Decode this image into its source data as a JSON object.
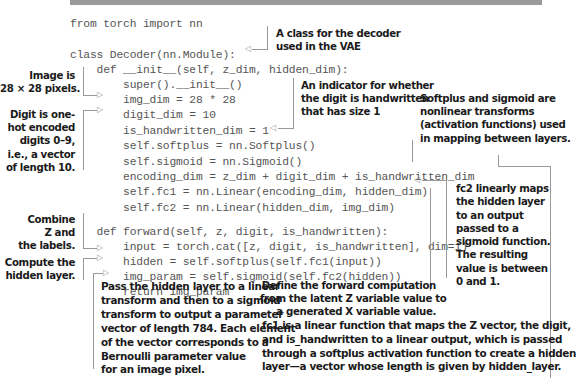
{
  "code_lines": [
    "from torch import nn",
    "",
    "class Decoder(nn.Module):",
    "    def __init__(self, z_dim, hidden_dim):",
    "        super().__init__()",
    "        img_dim = 28 * 28",
    "        digit_dim = 10",
    "        is_handwritten_dim = 1",
    "        self.softplus = nn.Softplus()",
    "        self.sigmoid = nn.Sigmoid()",
    "        encoding_dim = z_dim + digit_dim + is_handwritten_dim",
    "        self.fc1 = nn.Linear(encoding_dim, hidden_dim)",
    "        self.fc2 = nn.Linear(hidden_dim, img_dim)",
    "",
    "    def forward(self, z, digit, is_handwritten):",
    "        input = torch.cat([z, digit, is_handwritten], dim=1)",
    "        hidden = self.softplus(self.fc1(input))",
    "        img_param = self.sigmoid(self.fc2(hidden))",
    "        return img_param"
  ],
  "annotations": {
    "class_decoder": "A class for the decoder\nused in the VAE",
    "image_size": "Image is\n28 × 28 pixels.",
    "digit_onehot": "Digit is one-\nhot encoded\ndigits 0–9,\ni.e., a vector\nof length 10.",
    "is_handwritten": "An indicator for whether\nthe digit is handwritten\nthat has size 1",
    "activations": "Softplus and sigmoid are\nnonlinear transforms\n(activation functions) used\nin mapping between layers.",
    "fc2": "fc2 linearly maps\nthe hidden layer\nto an output\npassed to a\nsigmoid function.\nThe resulting\nvalue is between\n0 and 1.",
    "combine": "Combine\nZ and\nthe labels.",
    "compute_hidden": "Compute the\nhidden layer.",
    "forward_def": "Define the forward computation\nfrom the latent Z variable value to\na generated X variable value.",
    "pass_hidden": "Pass the hidden layer to a linear\ntransform and then to a sigmoid\ntransform to output a parameter\nvector of length 784. Each element\nof the vector corresponds to a\nBernoulli parameter value\nfor an image pixel.",
    "fc1": "fc1 is a linear function that maps the Z vector, the digit,\nand is_handwritten to a linear output, which is passed\nthrough a softplus activation function to create a hidden\nlayer—a vector whose length is given by hidden_layer."
  },
  "icons": {
    "arrow_right": "▷",
    "arrow_left": "◁"
  }
}
